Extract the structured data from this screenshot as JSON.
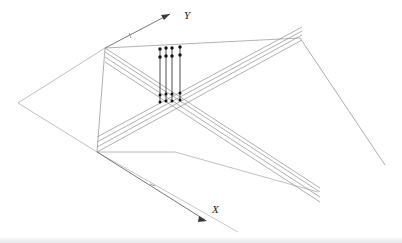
{
  "figure": {
    "background_color": "#ffffff",
    "line_color": "#9a9a9a",
    "dark_line_color": "#4a4a4a",
    "marker_color": "#1a1a1a",
    "width": 402,
    "height": 243
  },
  "axes": {
    "y_axis": {
      "label": "Y",
      "label_x": 184,
      "label_y": 18,
      "origin": [
        105,
        48
      ],
      "tip": [
        168,
        15
      ],
      "tick_x": 128,
      "tick_y": 36
    },
    "x_axis": {
      "label": "X",
      "label_x": 214,
      "label_y": 212,
      "origin": [
        97,
        152
      ],
      "tip": [
        207,
        221
      ],
      "tick_x": 152,
      "tick_y": 186
    }
  },
  "vertices": {
    "top_left": [
      105,
      48
    ],
    "bottom_left": [
      97,
      152
    ],
    "far_left": [
      18,
      103
    ],
    "top_right": [
      300,
      38
    ],
    "right_end": [
      385,
      165
    ],
    "mid_horizontal_end": [
      175,
      152
    ],
    "lower_right_end": [
      318,
      192
    ]
  },
  "base_plane": {
    "points": "18,103 105,48 300,38 238,232",
    "description": "large ground parallelogram outline"
  },
  "rail_bundles": [
    {
      "name": "upper-rail-bundle",
      "from": [
        105,
        48
      ],
      "to": [
        320,
        188
      ],
      "count": 4,
      "offsets": [
        0,
        4,
        8,
        12
      ]
    },
    {
      "name": "lower-rail-bundle",
      "from": [
        97,
        152
      ],
      "to": [
        302,
        40
      ],
      "count": 4,
      "offsets": [
        0,
        4,
        8,
        12
      ]
    }
  ],
  "stems": {
    "name": "vertical-stem-group",
    "count": 4,
    "x_positions": [
      160,
      166,
      172,
      180
    ],
    "top_y": 48,
    "bottom_y": 102,
    "marker_radius": 1.6,
    "marker_rows": [
      50,
      57,
      95,
      101
    ]
  },
  "crossing": {
    "center": [
      170,
      100
    ],
    "description": "X intersection of the two rail bundles"
  }
}
